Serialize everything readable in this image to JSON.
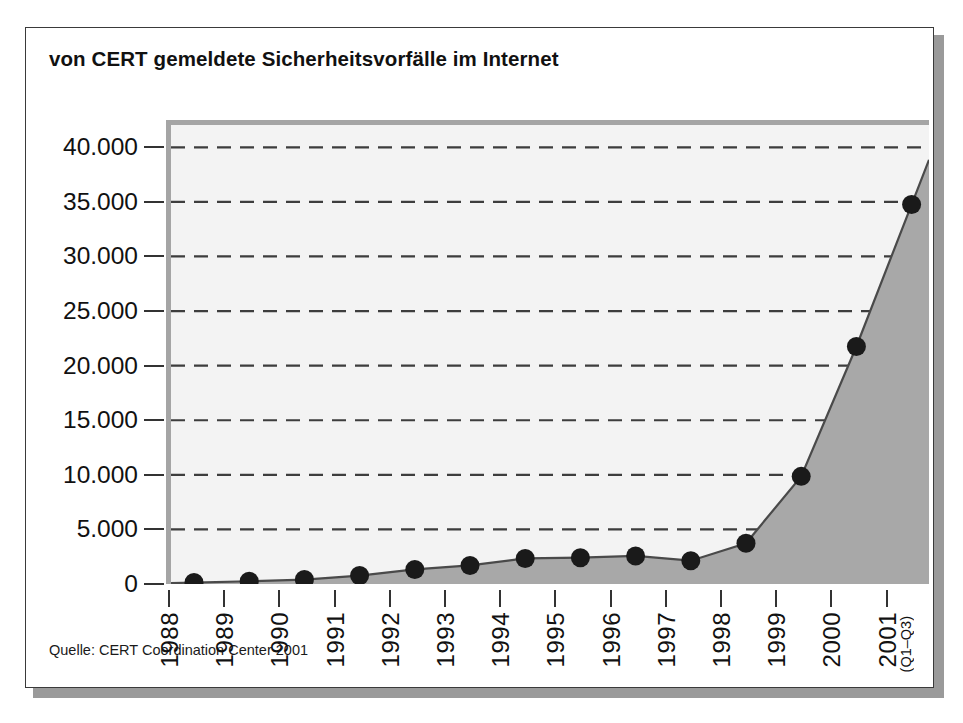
{
  "chart_data": {
    "type": "area",
    "title": "von CERT gemeldete Sicherheitsvorfälle im Internet",
    "source": "Quelle: CERT Coordination Center 2001",
    "xlabel": "",
    "ylabel": "",
    "grid": true,
    "legend_position": "none",
    "ylim": [
      0,
      42500
    ],
    "yticks": [
      0,
      5000,
      10000,
      15000,
      20000,
      25000,
      30000,
      35000,
      40000
    ],
    "ytick_labels": [
      "0",
      "5.000",
      "10.000",
      "15.000",
      "20.000",
      "25.000",
      "30.000",
      "35.000",
      "40.000"
    ],
    "categories": [
      "1988",
      "1989",
      "1990",
      "1991",
      "1992",
      "1993",
      "1994",
      "1995",
      "1996",
      "1997",
      "1998",
      "1999",
      "2000",
      "2001"
    ],
    "category_sublabels": [
      "",
      "",
      "",
      "",
      "",
      "",
      "",
      "",
      "",
      "",
      "",
      "",
      "",
      "(Q1–Q3)"
    ],
    "values": [
      132,
      252,
      406,
      773,
      1334,
      1701,
      2340,
      2412,
      2573,
      2134,
      3734,
      9859,
      21756,
      34754
    ],
    "series": [
      {
        "name": "gemeldete Sicherheitsvorfälle",
        "values": [
          132,
          252,
          406,
          773,
          1334,
          1701,
          2340,
          2412,
          2573,
          2134,
          3734,
          9859,
          21756,
          34754
        ]
      }
    ],
    "colors": {
      "plot_background": "#f3f3f3",
      "area_fill": "#a8a8a8",
      "line": "#4a4a4a",
      "marker": "#1a1a1a",
      "gridline": "#3d3d3d",
      "axis_band": "#a5a5a5",
      "frame": "#3a3a3a",
      "shadow": "#9a9a9a",
      "text": "#111111"
    }
  }
}
